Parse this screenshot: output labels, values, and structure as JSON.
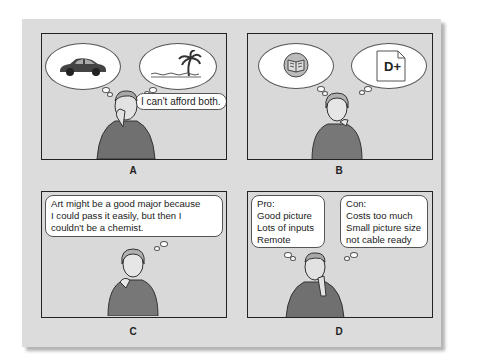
{
  "panels": [
    {
      "id": "A",
      "label": "A",
      "speech": "I can't afford both.",
      "thoughts": [
        "car-icon",
        "beach-palm-icon"
      ]
    },
    {
      "id": "B",
      "label": "B",
      "thoughts": [
        "book-icon",
        "grade-paper-icon"
      ],
      "grade": "D+"
    },
    {
      "id": "C",
      "label": "C",
      "thought_lines": [
        "Art might be a good major because",
        "I could pass it easily, but then I",
        "couldn't be a chemist."
      ]
    },
    {
      "id": "D",
      "label": "D",
      "pro": {
        "title": "Pro:",
        "items": [
          "Good picture",
          "Lots of inputs",
          "Remote"
        ]
      },
      "con": {
        "title": "Con:",
        "items": [
          "Costs too much",
          "Small picture size",
          "not cable ready"
        ]
      }
    }
  ],
  "colors": {
    "panel_bg": "#d9d9d9",
    "sheet_bg": "#dcdcdc",
    "border": "#222222",
    "sweater": "#6e6e6e"
  }
}
